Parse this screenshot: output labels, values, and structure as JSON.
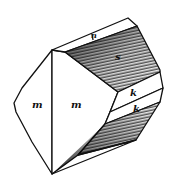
{
  "figure": {
    "type": "crystal drawing",
    "faces": [
      {
        "id": "m-left",
        "label": "m"
      },
      {
        "id": "m-front",
        "label": "m"
      },
      {
        "id": "top-strip",
        "label": "n"
      },
      {
        "id": "upper-shaded",
        "label": "s"
      },
      {
        "id": "k-upper",
        "label": "k"
      },
      {
        "id": "k-lower",
        "label": "k"
      },
      {
        "id": "lower-shaded",
        "label": "s"
      }
    ]
  }
}
